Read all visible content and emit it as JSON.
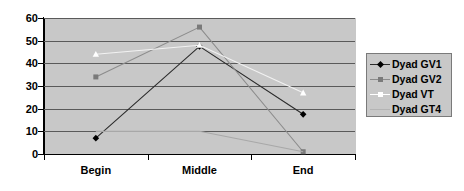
{
  "chart_data": {
    "type": "line",
    "title": "",
    "subtitle": "",
    "xlabel": "",
    "ylabel": "",
    "categories": [
      "Begin",
      "Middle",
      "End"
    ],
    "ylim": [
      0,
      60
    ],
    "ytick_labels": [
      "0",
      "10",
      "20",
      "30",
      "40",
      "50",
      "60"
    ],
    "ytick_values": [
      0,
      10,
      20,
      30,
      40,
      50,
      60
    ],
    "grid": true,
    "legend_position": "right",
    "series": [
      {
        "name": "Dyad GV1",
        "values": [
          7,
          47.5,
          17.5
        ],
        "color": "#2b2b2b",
        "marker": "diamond",
        "marker_color": "#000000"
      },
      {
        "name": "Dyad GV2",
        "values": [
          34,
          56,
          1
        ],
        "color": "#8c8c8c",
        "marker": "square",
        "marker_color": "#7a7a7a"
      },
      {
        "name": "Dyad VT",
        "values": [
          44,
          48,
          27
        ],
        "color": "#f2f2f2",
        "marker": "triangle",
        "marker_color": "#ffffff"
      },
      {
        "name": "Dyad GT4",
        "values": [
          10,
          10,
          1
        ],
        "color": "#a8a8a8",
        "marker": "none",
        "marker_color": "#a8a8a8"
      }
    ]
  },
  "legend": {
    "entries": [
      {
        "label": "Dyad GV1"
      },
      {
        "label": "Dyad GV2"
      },
      {
        "label": "Dyad VT"
      },
      {
        "label": "Dyad GT4"
      }
    ]
  },
  "style": {
    "plot_background": "#c8c8c8",
    "gridline_color": "#5a5a5a",
    "axis_color": "#000000",
    "page_background": "#ffffff"
  }
}
